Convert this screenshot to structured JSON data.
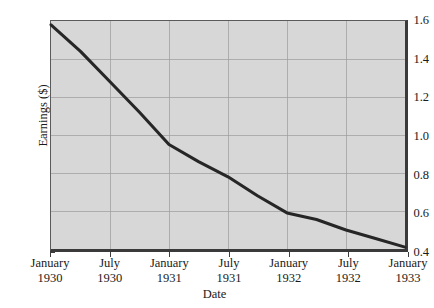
{
  "chart_data": {
    "type": "line",
    "title": "",
    "subtitle": "",
    "xlabel": "Date",
    "ylabel": "Earnings ($)",
    "grid": true,
    "legend": "none",
    "xlim": [
      0,
      36
    ],
    "ylim": [
      0.4,
      1.6
    ],
    "yticks": [
      "1.6",
      "1.4",
      "1.2",
      "1.0",
      "0.8",
      "0.6",
      "0.4"
    ],
    "ytick_values": [
      1.6,
      1.4,
      1.2,
      1.0,
      0.8,
      0.6,
      0.4
    ],
    "xticks": [
      {
        "month": "January",
        "year": "1930"
      },
      {
        "month": "July",
        "year": "1930"
      },
      {
        "month": "January",
        "year": "1931"
      },
      {
        "month": "July",
        "year": "1931"
      },
      {
        "month": "January",
        "year": "1932"
      },
      {
        "month": "July",
        "year": "1932"
      },
      {
        "month": "January",
        "year": "1933"
      }
    ],
    "xtick_values": [
      0,
      6,
      12,
      18,
      24,
      30,
      36
    ],
    "x": [
      0,
      3,
      6,
      9,
      12,
      15,
      18,
      21,
      24,
      27,
      30,
      33,
      36
    ],
    "values": [
      1.58,
      1.44,
      1.28,
      1.12,
      0.95,
      0.86,
      0.78,
      0.68,
      0.59,
      0.555,
      0.5,
      0.455,
      0.41
    ],
    "series": [
      {
        "name": "Earnings",
        "color": "#262626",
        "x": [
          0,
          3,
          6,
          9,
          12,
          15,
          18,
          21,
          24,
          27,
          30,
          33,
          36
        ],
        "values": [
          1.58,
          1.44,
          1.28,
          1.12,
          0.95,
          0.86,
          0.78,
          0.68,
          0.59,
          0.555,
          0.5,
          0.455,
          0.41
        ]
      }
    ],
    "annotations": [],
    "colors": {
      "plot_background": "#d7d7d7",
      "page_background": "#ffffff",
      "gridline": "#9a9a9a",
      "axis": "#3a3a3a",
      "line": "#262626"
    }
  }
}
